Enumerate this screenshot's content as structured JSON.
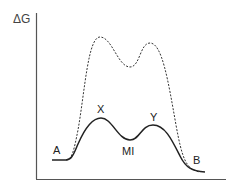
{
  "diagram": {
    "type": "energy-profile",
    "y_axis_label": "ΔG",
    "labels": {
      "start": "A",
      "end": "B",
      "peak1": "X",
      "intermediate": "MI",
      "peak2": "Y"
    },
    "curves": [
      {
        "name": "catalyzed",
        "style": "solid",
        "color": "#222222",
        "path": "M52,160 L66,160 C72,160 74,153 78,144 C85,128 92,118 101,118 C112,118 118,140 130,140 C140,140 141,125 153,125 C165,125 172,140 180,156 C186,168 192,171 205,172"
      },
      {
        "name": "uncatalyzed",
        "style": "dashed",
        "color": "#333333",
        "path": "M66,160 C72,160 74,150 78,130 C85,90 88,37 100,37 C112,37 118,67 130,67 C140,67 140,43 150,43 C162,43 168,80 176,125 C182,158 186,170 200,172"
      }
    ],
    "colors": {
      "axis": "#555555",
      "text": "#222222",
      "background": "#ffffff"
    }
  }
}
